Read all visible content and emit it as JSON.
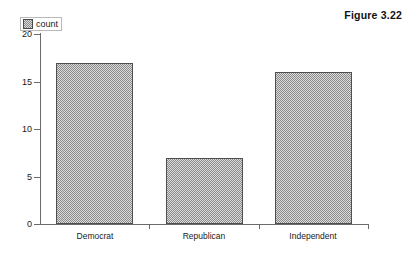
{
  "figure": {
    "caption": "Figure 3.22"
  },
  "legend": {
    "position": "top-left",
    "swatch_icon": "hatched-square-icon",
    "entries": [
      {
        "label": "count",
        "fill": "#dcdcdc",
        "pattern": "checkered-hatch",
        "border": "#4f4f4f"
      }
    ]
  },
  "chart_data": {
    "type": "bar",
    "title": "",
    "subtitle": "",
    "xlabel": "",
    "ylabel": "",
    "categories": [
      "Democrat",
      "Republican",
      "Independent"
    ],
    "values": [
      17,
      7,
      16
    ],
    "series": [
      {
        "name": "count",
        "values": [
          17,
          7,
          16
        ]
      }
    ],
    "ylim": [
      0,
      20
    ],
    "y_ticks": [
      0,
      5,
      10,
      15,
      20
    ],
    "y_tick_labels": [
      "0",
      "5",
      "10",
      "15",
      "20"
    ],
    "grid": false,
    "legend_position": "top-left",
    "bar_fill": "#dcdcdc",
    "bar_border": "#4f4f4f",
    "axis_color": "#6b6b6b",
    "background": "#ffffff"
  }
}
